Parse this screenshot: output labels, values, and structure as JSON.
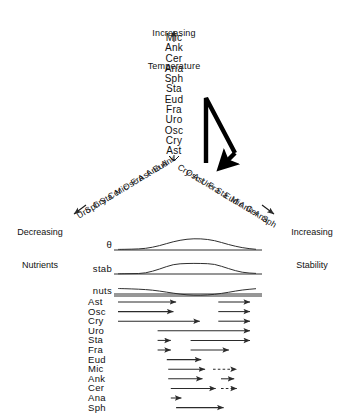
{
  "figure": {
    "title_top_line1": "Increasing",
    "title_top_line2": "Temperature",
    "axis_up_arrow": "up-arrow",
    "left_caption_line1": "Decreasing",
    "left_caption_line2": "Nutrients",
    "right_caption_line1": "Increasing",
    "right_caption_line2": "Stability",
    "bold_arrow_name": "succession-loop-arrow"
  },
  "vertical_list": {
    "name": "temperature-ordered-species",
    "items": [
      "Mic",
      "Ank",
      "Cer",
      "Ana",
      "Sph",
      "Sta",
      "Eud",
      "Fra",
      "Uro",
      "Osc",
      "Cry",
      "Ast"
    ]
  },
  "left_branch": {
    "name": "decreasing-nutrients-branch",
    "items": [
      "Ank",
      "Eud",
      "Ana",
      "Ast",
      "Fra",
      "Osc",
      "Mic",
      "Cer",
      "Sta",
      "Cry",
      "Sph",
      "Uro"
    ]
  },
  "right_branch": {
    "name": "increasing-stability-branch",
    "items": [
      "Cry",
      "Osc",
      "Ast",
      "Uro",
      "Fra",
      "Sta",
      "Eud",
      "Mic",
      "Ank",
      "Cer",
      "Ana",
      "Sph"
    ]
  },
  "curves": {
    "rows": [
      {
        "label": "θ",
        "name": "theta-curve",
        "shape": "hump"
      },
      {
        "label": "stab",
        "name": "stability-curve",
        "shape": "plateau"
      },
      {
        "label": "nuts",
        "name": "nutrients-curve",
        "shape": "dip"
      }
    ]
  },
  "chart_data": {
    "type": "line",
    "title": "",
    "xlabel": "",
    "ylabel": "",
    "grid": false,
    "legend": "none",
    "x": [
      0,
      0.1,
      0.2,
      0.3,
      0.4,
      0.5,
      0.6,
      0.7,
      0.8,
      0.9,
      1.0
    ],
    "series": [
      {
        "name": "θ",
        "values": [
          0.05,
          0.07,
          0.12,
          0.35,
          0.7,
          0.92,
          0.95,
          0.8,
          0.45,
          0.18,
          0.06
        ]
      },
      {
        "name": "stab",
        "values": [
          0.02,
          0.03,
          0.06,
          0.4,
          0.82,
          0.88,
          0.88,
          0.84,
          0.45,
          0.12,
          0.05
        ]
      },
      {
        "name": "nuts",
        "values": [
          0.92,
          0.88,
          0.8,
          0.62,
          0.35,
          0.12,
          0.08,
          0.18,
          0.45,
          0.75,
          0.9
        ]
      }
    ]
  },
  "species_rows": {
    "name": "species-occurrence-rows",
    "rows": [
      {
        "label": "Ast",
        "segments": [
          {
            "start": 0,
            "end": 44,
            "style": "solid"
          },
          {
            "start": 76,
            "end": 100,
            "style": "solid"
          }
        ]
      },
      {
        "label": "Osc",
        "segments": [
          {
            "start": 0,
            "end": 42,
            "style": "solid"
          },
          {
            "start": 76,
            "end": 100,
            "style": "solid"
          }
        ]
      },
      {
        "label": "Cry",
        "segments": [
          {
            "start": 0,
            "end": 62,
            "style": "solid"
          },
          {
            "start": 76,
            "end": 100,
            "style": "solid"
          }
        ]
      },
      {
        "label": "Uro",
        "segments": [
          {
            "start": 30,
            "end": 100,
            "style": "solid"
          }
        ]
      },
      {
        "label": "Sta",
        "segments": [
          {
            "start": 30,
            "end": 40,
            "style": "solid"
          },
          {
            "start": 55,
            "end": 100,
            "style": "solid"
          }
        ]
      },
      {
        "label": "Fra",
        "segments": [
          {
            "start": 30,
            "end": 40,
            "style": "solid"
          },
          {
            "start": 55,
            "end": 84,
            "style": "solid"
          }
        ]
      },
      {
        "label": "Eud",
        "segments": [
          {
            "start": 37,
            "end": 63,
            "style": "solid"
          }
        ]
      },
      {
        "label": "Mic",
        "segments": [
          {
            "start": 38,
            "end": 66,
            "style": "solid"
          },
          {
            "start": 72,
            "end": 90,
            "style": "dashed"
          }
        ]
      },
      {
        "label": "Ank",
        "segments": [
          {
            "start": 38,
            "end": 64,
            "style": "solid"
          },
          {
            "start": 78,
            "end": 88,
            "style": "solid"
          }
        ]
      },
      {
        "label": "Cer",
        "segments": [
          {
            "start": 40,
            "end": 74,
            "style": "solid"
          },
          {
            "start": 78,
            "end": 90,
            "style": "dashed"
          }
        ]
      },
      {
        "label": "Ana",
        "segments": [
          {
            "start": 40,
            "end": 48,
            "style": "solid"
          }
        ]
      },
      {
        "label": "Sph",
        "segments": [
          {
            "start": 44,
            "end": 80,
            "style": "solid"
          }
        ]
      }
    ]
  },
  "colors": {
    "ink": "#111111",
    "line": "#333333",
    "background": "#ffffff"
  }
}
